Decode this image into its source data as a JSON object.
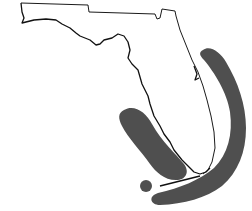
{
  "map": {
    "region": "Florida",
    "background_color": "#ffffff",
    "outline_color": "#000000",
    "zone_color": "#4f4f4f",
    "zones": [
      {
        "name": "atlantic-arc-zone",
        "description": "curved band off east coast and south of Keys"
      },
      {
        "name": "gulf-west-zone",
        "description": "elongated band off southwest Gulf coast"
      },
      {
        "name": "dry-tortugas-zone",
        "description": "small circular area west of Keys"
      }
    ]
  }
}
